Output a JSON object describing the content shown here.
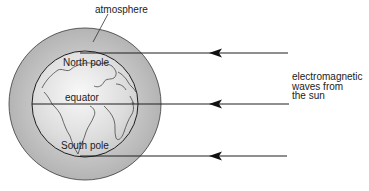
{
  "labels": {
    "atmosphere": "atmosphere",
    "north_pole": "North pole",
    "equator": "equator",
    "south_pole": "South pole"
  },
  "caption": {
    "lines": [
      "electromagnetic",
      "waves from",
      "the sun"
    ]
  },
  "arrows": [
    {
      "name": "wave-arrow-top",
      "y": 53
    },
    {
      "name": "wave-arrow-middle",
      "y": 104
    },
    {
      "name": "wave-arrow-bottom",
      "y": 156
    }
  ],
  "colors": {
    "atmosphere_fill": "#bdbdbd",
    "earth_fill": "#e4e4e4",
    "stroke": "#2a2a2a"
  }
}
